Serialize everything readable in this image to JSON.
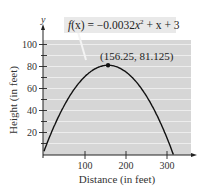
{
  "chart_data": {
    "type": "line",
    "title": "",
    "function_label": "f(x) = −0.0032x² + x + 3",
    "function": {
      "a": -0.0032,
      "b": 1,
      "c": 3
    },
    "xlabel": "Distance (in feet)",
    "ylabel": "Height (in feet)",
    "y_axis_letter": "y",
    "xlim": [
      0,
      340
    ],
    "ylim": [
      0,
      110
    ],
    "x_ticks": [
      100,
      200,
      300
    ],
    "y_ticks": [
      20,
      40,
      60,
      80,
      100
    ],
    "grid": "horizontal every 10",
    "series": [
      {
        "name": "f(x)",
        "x": [
          0,
          25,
          50,
          75,
          100,
          125,
          150,
          156.25,
          175,
          200,
          225,
          250,
          275,
          300,
          315.5
        ],
        "values": [
          3,
          26,
          45,
          60,
          71,
          78,
          81,
          81.125,
          80,
          75,
          66,
          53,
          36,
          15,
          0.0
        ]
      }
    ],
    "annotations": [
      {
        "label": "(156.25, 81.125)",
        "x": 156.25,
        "y": 81.125,
        "type": "vertex-point"
      }
    ],
    "colors": {
      "plot_background": "#d6d6d6",
      "grid": "#f2f2f2",
      "curve": "#111111"
    }
  },
  "labels": {
    "y_letter": "y",
    "xlabel": "Distance (in feet)",
    "ylabel": "Height (in feet)",
    "vertex": "(156.25, 81.125)",
    "x_ticks": [
      "100",
      "200",
      "300"
    ],
    "y_ticks": [
      "20",
      "40",
      "60",
      "80",
      "100"
    ],
    "eq_prefix": "f",
    "eq_x": "(x) = −0.0032",
    "eq_var": "x",
    "eq_sup": "2",
    "eq_rest": " + x + 3"
  }
}
